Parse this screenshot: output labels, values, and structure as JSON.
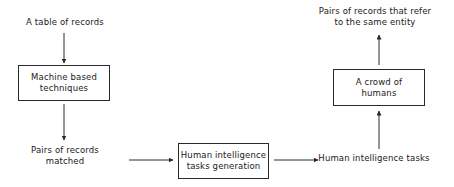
{
  "diagram": {
    "background_color": "#ffffff",
    "stroke_color": "#2a2a2a",
    "text_color": "#1a1a1a",
    "nodes": {
      "table_of_records": {
        "label": "A table of records",
        "shape": "text"
      },
      "machine_based_techniques": {
        "label": "Machine based\ntechniques",
        "shape": "box"
      },
      "pairs_of_records_matched": {
        "label": "Pairs of records\nmatched",
        "shape": "text"
      },
      "hit_generation": {
        "label": "Human intelligence\ntasks generation",
        "shape": "box"
      },
      "human_intelligence_tasks": {
        "label": "Human intelligence tasks",
        "shape": "text"
      },
      "crowd_of_humans": {
        "label": "A crowd of\nhumans",
        "shape": "box"
      },
      "pairs_same_entity": {
        "label": "Pairs of records that refer\nto the same entity",
        "shape": "text"
      }
    },
    "edges": [
      {
        "from": "table_of_records",
        "to": "machine_based_techniques",
        "direction": "down"
      },
      {
        "from": "machine_based_techniques",
        "to": "pairs_of_records_matched",
        "direction": "down"
      },
      {
        "from": "pairs_of_records_matched",
        "to": "hit_generation",
        "direction": "right"
      },
      {
        "from": "hit_generation",
        "to": "human_intelligence_tasks",
        "direction": "right"
      },
      {
        "from": "human_intelligence_tasks",
        "to": "crowd_of_humans",
        "direction": "up"
      },
      {
        "from": "crowd_of_humans",
        "to": "pairs_same_entity",
        "direction": "up"
      }
    ]
  }
}
